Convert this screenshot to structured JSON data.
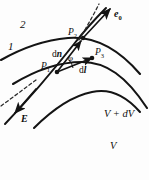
{
  "figure": {
    "background_color": "#fdfdfd",
    "ink_color": "#141414",
    "width": 149,
    "height": 180
  },
  "curve_labels": {
    "upper": "2",
    "lower": "1"
  },
  "points": {
    "p1": {
      "name": "P",
      "sub": "1"
    },
    "p2": {
      "name": "P",
      "sub": "2"
    },
    "p3": {
      "name": "P",
      "sub": "3"
    }
  },
  "vectors": {
    "e0": {
      "symbol": "e",
      "sub": "0"
    },
    "E": {
      "symbol": "E",
      "sub": ""
    },
    "dn": {
      "prefix": "d",
      "symbol": "n"
    },
    "dl": {
      "prefix": "d",
      "symbol": "l"
    }
  },
  "angle": {
    "symbol": "φ"
  },
  "potentials": {
    "outer": "V + dV",
    "inner": "V"
  },
  "geometry": {
    "equipotentials": [
      "M 1 60 C 22 48 46 40 68 38 C 92 36 116 46 140 74",
      "M 13 84 C 36 70 60 62 82 62 C 106 62 126 76 147 108",
      "M 34 128 C 52 110 72 96 92 92 C 110 88 126 96 140 112"
    ],
    "field_line": "M 5 124 C 28 100 52 72 74 44 C 88 26 98 16 106 8",
    "dash_upper": "M 79 40 C 86 28 93 16 99 4",
    "dash_lower": "M 1 106 L 36 80",
    "vector_dn": {
      "x1": 57,
      "y1": 72,
      "x2": 81,
      "y2": 41
    },
    "vector_dl": {
      "x1": 57,
      "y1": 72,
      "x2": 92,
      "y2": 58
    },
    "vector_e0": {
      "x1": 83,
      "y1": 38,
      "x2": 110,
      "y2": 9
    },
    "vector_E": {
      "x1": 36,
      "y1": 89,
      "x2": 15,
      "y2": 113
    },
    "dots": [
      {
        "cx": 57,
        "cy": 72,
        "r": 2.3
      },
      {
        "cx": 83,
        "cy": 38,
        "r": 2.3
      },
      {
        "cx": 92,
        "cy": 58,
        "r": 2.3
      }
    ]
  },
  "label_positions": {
    "curve2": {
      "left": 20,
      "top": 19
    },
    "curve1": {
      "left": 8,
      "top": 41
    },
    "e0": {
      "left": 114,
      "top": 9
    },
    "p2": {
      "left": 68,
      "top": 28
    },
    "p3": {
      "left": 95,
      "top": 48
    },
    "p1": {
      "left": 41,
      "top": 62
    },
    "dn": {
      "left": 52,
      "top": 50
    },
    "dl": {
      "left": 79,
      "top": 66
    },
    "phi": {
      "left": 68,
      "top": 54
    },
    "v_dv": {
      "left": 104,
      "top": 109
    },
    "v": {
      "left": 110,
      "top": 141
    },
    "E": {
      "left": 21,
      "top": 114
    }
  }
}
